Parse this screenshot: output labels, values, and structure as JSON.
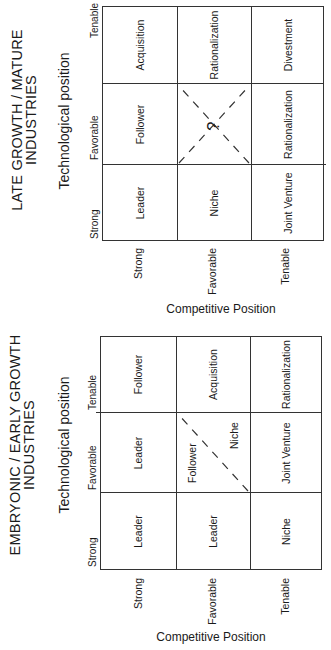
{
  "orientation": "page rotated 90 degrees counter-clockwise",
  "matrices": [
    {
      "title_line1": "EMBRYONIC / EARLY  GROWTH",
      "title_line2": "INDUSTRIES",
      "x_axis_title": "Technological position",
      "columns": [
        "Strong",
        "Favorable",
        "Tenable"
      ],
      "y_axis_title": "Competitive Position",
      "rows": [
        "Strong",
        "Favorable",
        "Tenable"
      ],
      "cells": [
        [
          "Leader",
          "Leader",
          "Follower"
        ],
        [
          "Leader",
          "Follower | Niche",
          "Acquisition"
        ],
        [
          "Niche",
          "Joint Venture",
          "Rationalization"
        ]
      ],
      "split_cell": {
        "upper_left": "Follower",
        "lower_right": "Niche"
      }
    },
    {
      "title_line1": "LATE  GROWTH / MATURE",
      "title_line2": "INDUSTRIES",
      "x_axis_title": "Technological position",
      "columns": [
        "Strong",
        "Favorable",
        "Tenable"
      ],
      "y_axis_title": "Competitive Position",
      "rows": [
        "Strong",
        "Favorable",
        "Tenable"
      ],
      "cells": [
        [
          "Leader",
          "Follower",
          "Acquisition"
        ],
        [
          "Niche",
          "?",
          "Rationalization"
        ],
        [
          "Joint Venture",
          "Rationalization",
          "Divestment"
        ]
      ],
      "question_cell": "?"
    }
  ]
}
